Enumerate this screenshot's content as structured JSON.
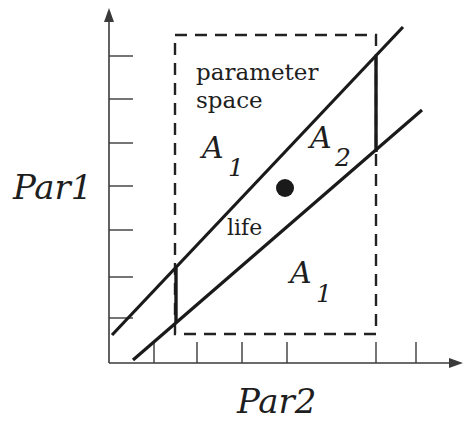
{
  "diagram": {
    "axes": {
      "y_label": "Par1",
      "x_label": "Par2",
      "y_ticks": 7,
      "x_ticks": 6
    },
    "box": {
      "label_line1": "parameter",
      "label_line2": "space",
      "style": "dashed"
    },
    "regions": {
      "a1_upper": {
        "letter": "A",
        "subscript": "1"
      },
      "a2": {
        "letter": "A",
        "subscript": "2"
      },
      "a1_lower": {
        "letter": "A",
        "subscript": "1"
      },
      "life": "life"
    },
    "point": {
      "shape": "filled-circle",
      "color": "#1a1a1a"
    },
    "colors": {
      "ink": "#1a1a1a",
      "background": "#ffffff"
    }
  }
}
